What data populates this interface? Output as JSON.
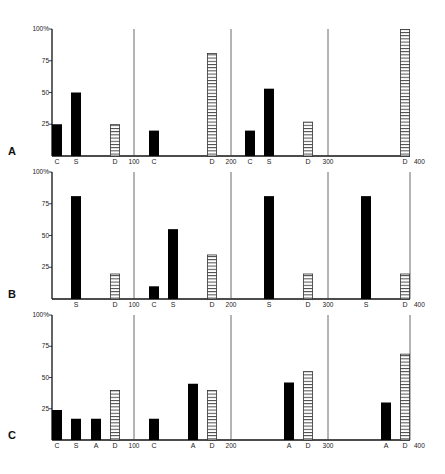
{
  "chart_data": {
    "type": "bar",
    "title": "",
    "xlabel": "",
    "ylabel": "%",
    "ylim": [
      0,
      100
    ],
    "y_ticks": [
      "100%",
      "75",
      "50",
      "25"
    ],
    "x_section_labels": [
      "100",
      "200",
      "300",
      "400"
    ],
    "legend": {
      "solid": "Filled bars: C, S, A",
      "hatched": "Hatched bars: D"
    },
    "panels": [
      {
        "label": "A",
        "sections": [
          {
            "range": "0-100",
            "bars": [
              {
                "cat": "C",
                "value": 25,
                "style": "solid"
              },
              {
                "cat": "S",
                "value": 50,
                "style": "solid"
              },
              {
                "cat": "D",
                "value": 25,
                "style": "hatched"
              }
            ]
          },
          {
            "range": "100-200",
            "bars": [
              {
                "cat": "C",
                "value": 20,
                "style": "solid"
              },
              {
                "cat": "D",
                "value": 81,
                "style": "hatched"
              }
            ]
          },
          {
            "range": "200-300",
            "bars": [
              {
                "cat": "C",
                "value": 20,
                "style": "solid"
              },
              {
                "cat": "S",
                "value": 53,
                "style": "solid"
              },
              {
                "cat": "D",
                "value": 27,
                "style": "hatched"
              }
            ]
          },
          {
            "range": "300-400",
            "bars": [
              {
                "cat": "D",
                "value": 100,
                "style": "hatched"
              }
            ]
          }
        ]
      },
      {
        "label": "B",
        "sections": [
          {
            "range": "0-100",
            "bars": [
              {
                "cat": "S",
                "value": 81,
                "style": "solid"
              },
              {
                "cat": "D",
                "value": 20,
                "style": "hatched"
              }
            ]
          },
          {
            "range": "100-200",
            "bars": [
              {
                "cat": "C",
                "value": 10,
                "style": "solid"
              },
              {
                "cat": "S",
                "value": 55,
                "style": "solid"
              },
              {
                "cat": "D",
                "value": 35,
                "style": "hatched"
              }
            ]
          },
          {
            "range": "200-300",
            "bars": [
              {
                "cat": "S",
                "value": 81,
                "style": "solid"
              },
              {
                "cat": "D",
                "value": 20,
                "style": "hatched"
              }
            ]
          },
          {
            "range": "300-400",
            "bars": [
              {
                "cat": "S",
                "value": 81,
                "style": "solid"
              },
              {
                "cat": "D",
                "value": 20,
                "style": "hatched"
              }
            ]
          }
        ]
      },
      {
        "label": "C",
        "sections": [
          {
            "range": "0-100",
            "bars": [
              {
                "cat": "C",
                "value": 24,
                "style": "solid"
              },
              {
                "cat": "S",
                "value": 17,
                "style": "solid"
              },
              {
                "cat": "A",
                "value": 17,
                "style": "solid"
              },
              {
                "cat": "D",
                "value": 40,
                "style": "hatched"
              }
            ]
          },
          {
            "range": "100-200",
            "bars": [
              {
                "cat": "C",
                "value": 17,
                "style": "solid"
              },
              {
                "cat": "A",
                "value": 45,
                "style": "solid"
              },
              {
                "cat": "D",
                "value": 40,
                "style": "hatched"
              }
            ]
          },
          {
            "range": "200-300",
            "bars": [
              {
                "cat": "A",
                "value": 46,
                "style": "solid"
              },
              {
                "cat": "D",
                "value": 55,
                "style": "hatched"
              }
            ]
          },
          {
            "range": "300-400",
            "bars": [
              {
                "cat": "A",
                "value": 30,
                "style": "solid"
              },
              {
                "cat": "D",
                "value": 69,
                "style": "hatched"
              }
            ]
          }
        ]
      }
    ]
  },
  "colors": {
    "bar_fill": "#000000",
    "hatch_line": "#333333",
    "axis": "#111111",
    "divider": "#444444",
    "background": "#ffffff"
  }
}
